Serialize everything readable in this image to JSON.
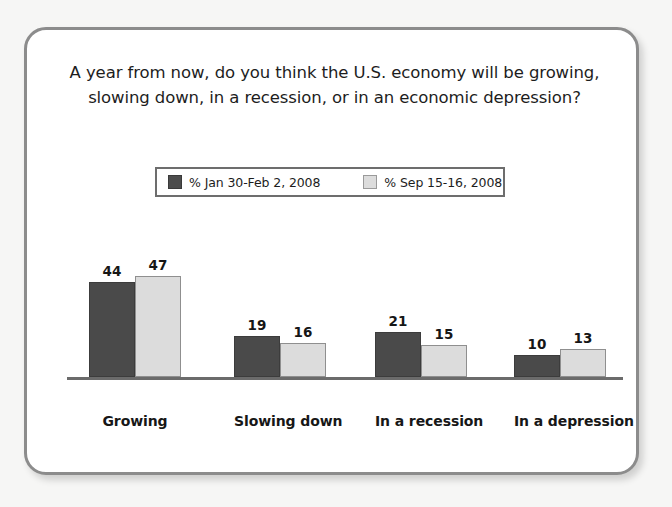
{
  "chart_data": {
    "type": "bar",
    "title": "A year from now, do you think the U.S. economy will be growing, slowing down, in a recession, or in an economic depression?",
    "title_lines": [
      "A year from now, do you think the U.S. economy will be growing,",
      "slowing down, in a recession, or in an economic depression?"
    ],
    "categories": [
      "Growing",
      "Slowing down",
      "In a recession",
      "In a depression"
    ],
    "series": [
      {
        "name": "% Jan 30-Feb 2, 2008",
        "color": "#4a4a4a",
        "values": [
          44,
          19,
          21,
          10
        ]
      },
      {
        "name": "% Sep 15-16, 2008",
        "color": "#dcdcdc",
        "values": [
          47,
          16,
          15,
          13
        ]
      }
    ],
    "xlabel": "",
    "ylabel": "",
    "ylim": [
      0,
      52
    ],
    "grid": false,
    "legend_position": "top-center",
    "value_labels": true,
    "axis_line_color": "#6b6b6b",
    "card_border_color": "#8c8c8c",
    "background_color": "#f6f6f5"
  },
  "legend": {
    "items": [
      {
        "label": "% Jan 30-Feb 2, 2008",
        "swatch": "dark-swatch"
      },
      {
        "label": "% Sep 15-16, 2008",
        "swatch": "light-swatch"
      }
    ]
  }
}
